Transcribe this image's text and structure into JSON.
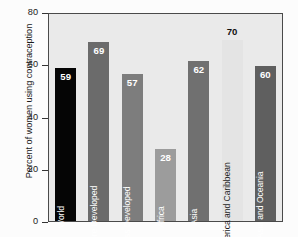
{
  "chart_data": {
    "type": "bar",
    "title": "",
    "xlabel": "",
    "ylabel": "Percent of women using contraception",
    "ylim": [
      0,
      80
    ],
    "yticks": [
      0,
      20,
      40,
      60,
      80
    ],
    "grid": false,
    "legend": "none",
    "categories": [
      "World",
      "More Developed",
      "Less Developed",
      "Africa",
      "Asia",
      "Latin America and Caribbean",
      "South Asia and Oceania"
    ],
    "values": [
      59,
      69,
      57,
      28,
      62,
      70,
      60
    ],
    "bar_colors": [
      "#050505",
      "#6b6b6b",
      "#7d7d7d",
      "#9c9c9c",
      "#707070",
      "#e4e4e4",
      "#5f5f5f"
    ],
    "bars": [
      {
        "label": "World",
        "value": 59,
        "value_text": "59",
        "color": "#050505",
        "pale": false
      },
      {
        "label": "More Developed",
        "value": 69,
        "value_text": "69",
        "color": "#6b6b6b",
        "pale": false
      },
      {
        "label": "Less Developed",
        "value": 57,
        "value_text": "57",
        "color": "#7d7d7d",
        "pale": false
      },
      {
        "label": "Africa",
        "value": 28,
        "value_text": "28",
        "color": "#9c9c9c",
        "pale": false
      },
      {
        "label": "Asia",
        "value": 62,
        "value_text": "62",
        "color": "#707070",
        "pale": false
      },
      {
        "label": "Latin America and Caribbean",
        "value": 70,
        "value_text": "70",
        "color": "#e4e4e4",
        "pale": true
      },
      {
        "label": "South Asia and Oceania",
        "value": 60,
        "value_text": "60",
        "color": "#5f5f5f",
        "pale": false
      }
    ]
  },
  "axis": {
    "ylabel": "Percent of women using contraception",
    "tick_labels": [
      "80",
      "60",
      "40",
      "20",
      "0"
    ]
  },
  "colors": {
    "plot_background": "#eaeaea",
    "figure_background": "#fcfcfc",
    "frame": "#4a4a4a",
    "text": "#1a1a1a"
  }
}
